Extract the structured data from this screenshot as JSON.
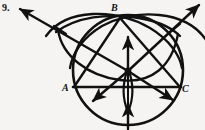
{
  "figure": {
    "number_label": "9.",
    "background_color": "#f5f4f2",
    "ink_color": "#111111",
    "vertex_labels": {
      "A": "A",
      "B": "B",
      "C": "C"
    },
    "geometry": {
      "main_circle": {
        "cx": 128,
        "cy": 70,
        "r": 55
      },
      "points": {
        "A": {
          "x": 74,
          "y": 87
        },
        "B": {
          "x": 120,
          "y": 17
        },
        "C": {
          "x": 180,
          "y": 87
        },
        "center": {
          "x": 128,
          "y": 71
        },
        "arc_cross_left": {
          "x": 60,
          "y": 30
        },
        "arc_cross_right": {
          "x": 174,
          "y": 28
        }
      },
      "arrow_endpoints": {
        "upper_left": {
          "x": 18,
          "y": 8
        },
        "upper_right": {
          "x": 200,
          "y": 4
        },
        "lower_left": {
          "x": 93,
          "y": 101
        },
        "lower_right": {
          "x": 174,
          "y": 101
        },
        "vertical_up": {
          "x": 128,
          "y": 36
        },
        "vertical_down": {
          "x": 128,
          "y": 128
        }
      }
    },
    "elements": [
      "main-circle",
      "triangle-side-ab",
      "triangle-side-bc",
      "triangle-side-ac",
      "construction-arc-from-a",
      "construction-arc-from-b",
      "construction-arc-from-c",
      "bisector-ray-upper-left",
      "bisector-ray-upper-right",
      "bisector-ray-lower-left",
      "bisector-ray-lower-right",
      "bisector-ray-vertical",
      "vesica-lens"
    ]
  }
}
